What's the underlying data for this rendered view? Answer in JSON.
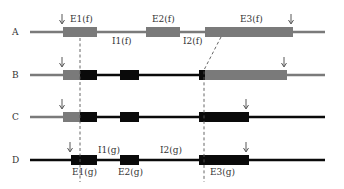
{
  "colors": {
    "gray": "#7a7a7a",
    "black": "#0a0a0a",
    "text": "#333333",
    "dash": "#555555"
  },
  "rows": [
    {
      "label": "A",
      "y": 32,
      "segments": [
        {
          "type": "line",
          "x1": 30,
          "x2": 325,
          "color": "gray"
        },
        {
          "type": "box",
          "x1": 63,
          "x2": 97,
          "color": "gray"
        },
        {
          "type": "box",
          "x1": 146,
          "x2": 180,
          "color": "gray"
        },
        {
          "type": "box",
          "x1": 205,
          "x2": 293,
          "color": "gray"
        }
      ],
      "arrows": [
        62,
        291
      ],
      "labels": [
        {
          "text": "E1(f)",
          "x": 70,
          "y": 22
        },
        {
          "text": "E2(f)",
          "x": 152,
          "y": 22
        },
        {
          "text": "E3(f)",
          "x": 240,
          "y": 22
        },
        {
          "text": "I1(f)",
          "x": 112,
          "y": 44
        },
        {
          "text": "I2(f)",
          "x": 183,
          "y": 44
        }
      ]
    },
    {
      "label": "B",
      "y": 75,
      "segments": [
        {
          "type": "line",
          "x1": 30,
          "x2": 63,
          "color": "gray"
        },
        {
          "type": "line",
          "x1": 97,
          "x2": 199,
          "color": "black"
        },
        {
          "type": "line",
          "x1": 287,
          "x2": 325,
          "color": "gray"
        },
        {
          "type": "box",
          "x1": 63,
          "x2": 80,
          "color": "gray"
        },
        {
          "type": "box",
          "x1": 80,
          "x2": 97,
          "color": "black"
        },
        {
          "type": "box",
          "x1": 120,
          "x2": 139,
          "color": "black"
        },
        {
          "type": "box",
          "x1": 199,
          "x2": 205,
          "color": "black"
        },
        {
          "type": "box",
          "x1": 205,
          "x2": 287,
          "color": "gray"
        }
      ],
      "arrows": [
        62,
        284
      ],
      "labels": []
    },
    {
      "label": "C",
      "y": 117,
      "segments": [
        {
          "type": "line",
          "x1": 30,
          "x2": 63,
          "color": "gray"
        },
        {
          "type": "line",
          "x1": 97,
          "x2": 325,
          "color": "black"
        },
        {
          "type": "box",
          "x1": 63,
          "x2": 80,
          "color": "gray"
        },
        {
          "type": "box",
          "x1": 80,
          "x2": 97,
          "color": "black"
        },
        {
          "type": "box",
          "x1": 120,
          "x2": 139,
          "color": "black"
        },
        {
          "type": "box",
          "x1": 199,
          "x2": 249,
          "color": "black"
        }
      ],
      "arrows": [
        62,
        246
      ],
      "labels": []
    },
    {
      "label": "D",
      "y": 160,
      "segments": [
        {
          "type": "line",
          "x1": 30,
          "x2": 325,
          "color": "black"
        },
        {
          "type": "box",
          "x1": 71,
          "x2": 97,
          "color": "black"
        },
        {
          "type": "box",
          "x1": 120,
          "x2": 139,
          "color": "black"
        },
        {
          "type": "box",
          "x1": 199,
          "x2": 249,
          "color": "black"
        }
      ],
      "arrows": [
        70,
        246
      ],
      "labels": [
        {
          "text": "I1(g)",
          "x": 98,
          "y": 153
        },
        {
          "text": "I2(g)",
          "x": 160,
          "y": 153
        },
        {
          "text": "E1(g)",
          "x": 72,
          "y": 175
        },
        {
          "text": "E2(g)",
          "x": 118,
          "y": 175
        },
        {
          "text": "E3(g)",
          "x": 210,
          "y": 175
        }
      ]
    }
  ],
  "dashed_guides": [
    {
      "points": [
        [
          80,
          38
        ],
        [
          80,
          182
        ]
      ]
    },
    {
      "points": [
        [
          221,
          37
        ],
        [
          204,
          70
        ],
        [
          204,
          182
        ]
      ]
    }
  ]
}
